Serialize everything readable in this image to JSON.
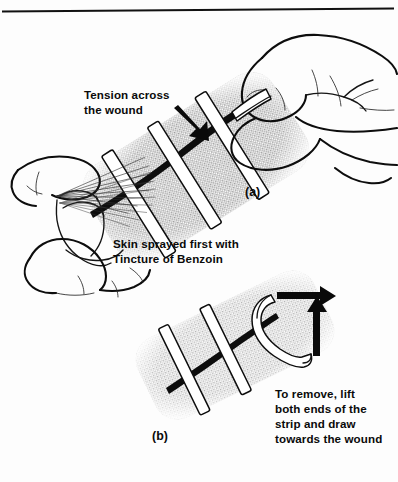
{
  "figure": {
    "background_color": "#fdfdfd",
    "ink_color": "#111111",
    "skin_tone_color": "#b9b9b9",
    "strip_color": "#ffffff",
    "top_rule": true
  },
  "annotations": {
    "tension_label_line1": "Tension across",
    "tension_label_line2": "the wound",
    "benzoin_label_line1": "Skin sprayed first with",
    "benzoin_label_line2": "Tincture of Benzoin",
    "remove_label_line1": "To remove, lift",
    "remove_label_line2": "both ends of the",
    "remove_label_line3": "strip and draw",
    "remove_label_line4": "towards the wound"
  },
  "panels": [
    {
      "id": "a",
      "label": "(a)",
      "description": "Two hands applying adhesive strips across a wound while a spray can applies Tincture of Benzoin",
      "strip_count": 3,
      "arrow_count": 1
    },
    {
      "id": "b",
      "label": "(b)",
      "description": "Skin patch with strips, one strip lifted at both ends and drawn towards the wound",
      "strip_count": 3,
      "arrow_count": 2
    }
  ]
}
